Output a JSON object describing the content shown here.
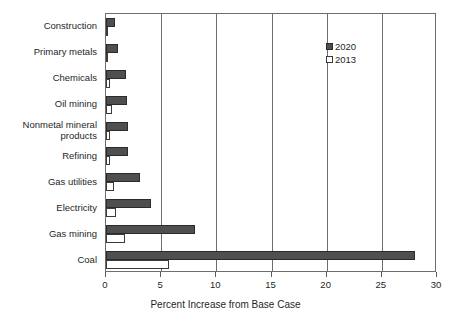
{
  "chart_data": {
    "type": "bar",
    "orientation": "horizontal",
    "title": "",
    "xlabel": "Percent Increase from Base Case",
    "ylabel": "",
    "xlim": [
      0,
      30
    ],
    "xticks": [
      0,
      5,
      10,
      15,
      20,
      25,
      30
    ],
    "xtick_labels": [
      "0",
      "5",
      "10",
      "15",
      "20",
      "25",
      "30"
    ],
    "grid": true,
    "grid_axis": "x",
    "legend_position": "upper right",
    "categories": [
      "Construction",
      "Primary metals",
      "Chemicals",
      "Oil mining",
      "Nonmetal mineral products",
      "Refining",
      "Gas utilities",
      "Electricity",
      "Gas mining",
      "Coal"
    ],
    "category_labels": [
      "Construction",
      "Primary metals",
      "Chemicals",
      "Oil mining",
      "Nonmetal mineral\nproducts",
      "Refining",
      "Gas utilities",
      "Electricity",
      "Gas mining",
      "Coal"
    ],
    "series": [
      {
        "name": "2020",
        "color": "#4f4f4f",
        "values": [
          0.8,
          1.1,
          1.8,
          1.9,
          2.0,
          2.0,
          3.1,
          4.1,
          8.1,
          28.0
        ]
      },
      {
        "name": "2013",
        "color": "#ffffff",
        "values": [
          0.1,
          0.2,
          0.4,
          0.5,
          0.4,
          0.4,
          0.7,
          0.9,
          1.7,
          5.7
        ]
      }
    ]
  },
  "legend": {
    "items": [
      {
        "label": "2020",
        "swatch": "filled-dark-square"
      },
      {
        "label": "2013",
        "swatch": "open-white-square"
      }
    ]
  },
  "colors": {
    "series_2020": "#4f4f4f",
    "series_2013": "#ffffff",
    "axis": "#6e6e6e",
    "text": "#1f1f1f",
    "background": "#ffffff"
  }
}
